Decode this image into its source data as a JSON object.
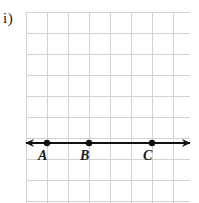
{
  "figure": {
    "item_label": "i)",
    "caption_visible": false,
    "background_color": "#ffffff",
    "grid": {
      "line_color": "#d2d2d2",
      "cell_size_px": 21,
      "origin_x_px": 26,
      "origin_y_px": 12,
      "columns": 8,
      "rows": 9,
      "width_px": 164,
      "height_px": 191
    },
    "number_line": {
      "stroke_color": "#111111",
      "stroke_width_px": 2,
      "y_px": 143,
      "left_arrow_tip_x_px": 26,
      "right_arrow_tip_x_px": 190,
      "has_left_arrow": true,
      "has_right_arrow": true
    },
    "points": [
      {
        "label": "A",
        "x_px": 47,
        "y_px": 143,
        "label_x_px": 38,
        "label_y_px": 149,
        "dot_radius_px": 3.2,
        "color": "#111111"
      },
      {
        "label": "B",
        "x_px": 89,
        "y_px": 143,
        "label_x_px": 80,
        "label_y_px": 149,
        "dot_radius_px": 3.2,
        "color": "#111111"
      },
      {
        "label": "C",
        "x_px": 152,
        "y_px": 143,
        "label_x_px": 143,
        "label_y_px": 149,
        "dot_radius_px": 3.2,
        "color": "#111111"
      }
    ]
  },
  "chart_data": {
    "type": "line",
    "title": "i)",
    "xlabel": "",
    "ylabel": "",
    "grid": true,
    "legend": "none",
    "categories": [
      "A",
      "B",
      "C"
    ],
    "x": [
      1,
      3,
      6
    ],
    "values": [
      0,
      0,
      0
    ],
    "xlim": [
      0,
      8
    ],
    "ylim": [
      -2,
      7
    ],
    "annotations": [
      {
        "text": "A",
        "x": 1,
        "y": 0
      },
      {
        "text": "B",
        "x": 3,
        "y": 0
      },
      {
        "text": "C",
        "x": 6,
        "y": 0
      }
    ]
  }
}
